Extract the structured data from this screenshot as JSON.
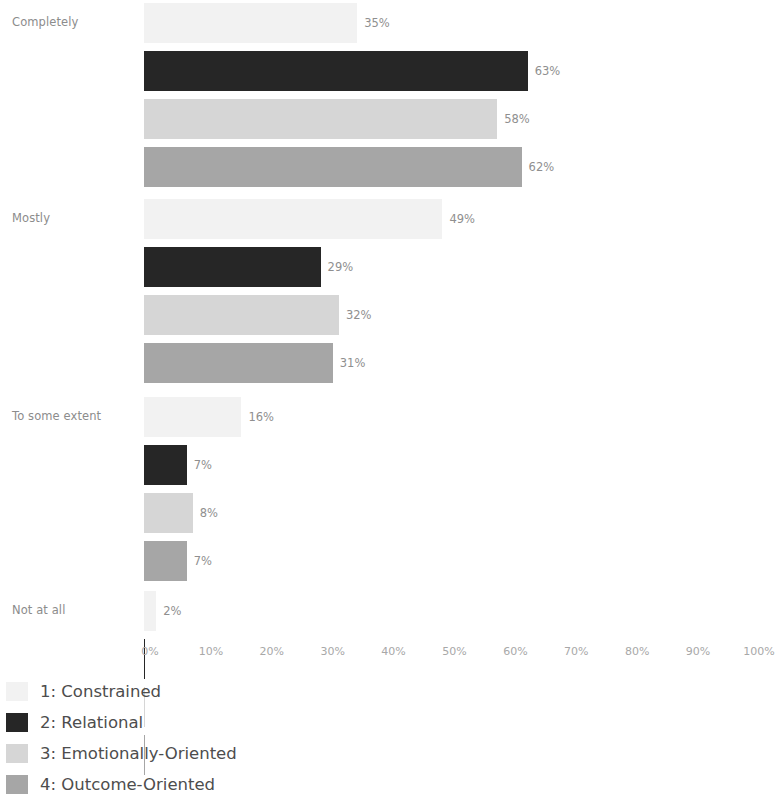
{
  "chart_data": {
    "type": "bar",
    "orientation": "horizontal",
    "title": "",
    "subtitle": "",
    "xlabel": "",
    "ylabel": "",
    "xlim": [
      0,
      100
    ],
    "grid": false,
    "legend_position": "bottom-left",
    "categories": [
      "Completely",
      "Mostly",
      "To some extent",
      "Not at all"
    ],
    "xticks": [
      "0%",
      "10%",
      "20%",
      "30%",
      "40%",
      "50%",
      "60%",
      "70%",
      "80%",
      "90%",
      "100%"
    ],
    "xtick_values": [
      0,
      10,
      20,
      30,
      40,
      50,
      60,
      70,
      80,
      90,
      100
    ],
    "series": [
      {
        "name": "1: Constrained",
        "color": "#f2f2f2",
        "values": [
          35,
          49,
          16,
          2
        ],
        "labels": [
          "35%",
          "49%",
          "16%",
          "2%"
        ]
      },
      {
        "name": "2: Relational",
        "color": "#262626",
        "values": [
          63,
          29,
          7,
          0
        ],
        "labels": [
          "63%",
          "29%",
          "7%",
          ""
        ]
      },
      {
        "name": "3: Emotionally-Oriented",
        "color": "#d6d6d6",
        "values": [
          58,
          32,
          8,
          0
        ],
        "labels": [
          "58%",
          "32%",
          "8%",
          ""
        ]
      },
      {
        "name": "4: Outcome-Oriented",
        "color": "#a6a6a6",
        "values": [
          62,
          31,
          7,
          0
        ],
        "labels": [
          "62%",
          "31%",
          "7%",
          ""
        ]
      }
    ]
  },
  "legend": {
    "items": [
      {
        "label": "1: Constrained",
        "color": "#f2f2f2"
      },
      {
        "label": "2: Relational",
        "color": "#262626"
      },
      {
        "label": "3: Emotionally-Oriented",
        "color": "#d6d6d6"
      },
      {
        "label": "4: Outcome-Oriented",
        "color": "#a6a6a6"
      }
    ]
  },
  "axis": {
    "y_labels": [
      "Completely",
      "Mostly",
      "To some extent",
      "Not at all"
    ],
    "x_labels": [
      "0%",
      "10%",
      "20%",
      "30%",
      "40%",
      "50%",
      "60%",
      "70%",
      "80%",
      "90%",
      "100%"
    ]
  }
}
